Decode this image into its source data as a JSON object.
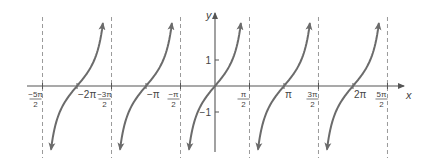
{
  "chart_data": {
    "type": "line",
    "title": "",
    "function": "y = tan x",
    "xlabel": "x",
    "ylabel": "y",
    "x_ticks": [
      {
        "value": -7.853981634,
        "label": "-5π/2",
        "num": "−5π",
        "den": "2",
        "kind": "asymptote"
      },
      {
        "value": -6.283185307,
        "label": "-2π",
        "text": "−2π",
        "kind": "zero"
      },
      {
        "value": -4.71238898,
        "label": "-3π/2",
        "num": "−3π",
        "den": "2",
        "kind": "asymptote"
      },
      {
        "value": -3.141592654,
        "label": "-π",
        "text": "−π",
        "kind": "zero"
      },
      {
        "value": -1.570796327,
        "label": "-π/2",
        "num": "−π",
        "den": "2",
        "kind": "asymptote"
      },
      {
        "value": 1.570796327,
        "label": "π/2",
        "num": "π",
        "den": "2",
        "kind": "asymptote"
      },
      {
        "value": 3.141592654,
        "label": "π",
        "text": "π",
        "kind": "zero"
      },
      {
        "value": 4.71238898,
        "label": "3π/2",
        "num": "3π",
        "den": "2",
        "kind": "asymptote"
      },
      {
        "value": 6.283185307,
        "label": "2π",
        "text": "2π",
        "kind": "zero"
      },
      {
        "value": 7.853981634,
        "label": "5π/2",
        "num": "5π",
        "den": "2",
        "kind": "asymptote"
      }
    ],
    "y_ticks": [
      {
        "value": 1,
        "label": "1"
      },
      {
        "value": -1,
        "label": "−1"
      }
    ],
    "asymptotes": [
      -7.853981634,
      -4.71238898,
      -1.570796327,
      1.570796327,
      4.71238898,
      7.853981634
    ],
    "branch_centers": [
      -6.283185307,
      -3.141592654,
      0,
      3.141592654,
      6.283185307
    ],
    "ylim": [
      -2.5,
      2.8
    ],
    "xlim": [
      -8.6,
      8.6
    ],
    "grid": false,
    "colors": {
      "curve": "#6b6b6b",
      "axis": "#555555",
      "asymptote": "#9a9a9a",
      "label": "#444444"
    },
    "layout": {
      "origin_px": [
        215,
        86
      ],
      "px_per_unit_x": 21.96,
      "px_per_unit_y": 26,
      "x_axis_from": 27,
      "x_axis_to": 404,
      "y_axis_from": 152,
      "y_axis_to": 13,
      "curve_y_max": 2.42,
      "curve_y_min": -2.45,
      "asym_top": 17,
      "asym_bottom": 158
    }
  }
}
